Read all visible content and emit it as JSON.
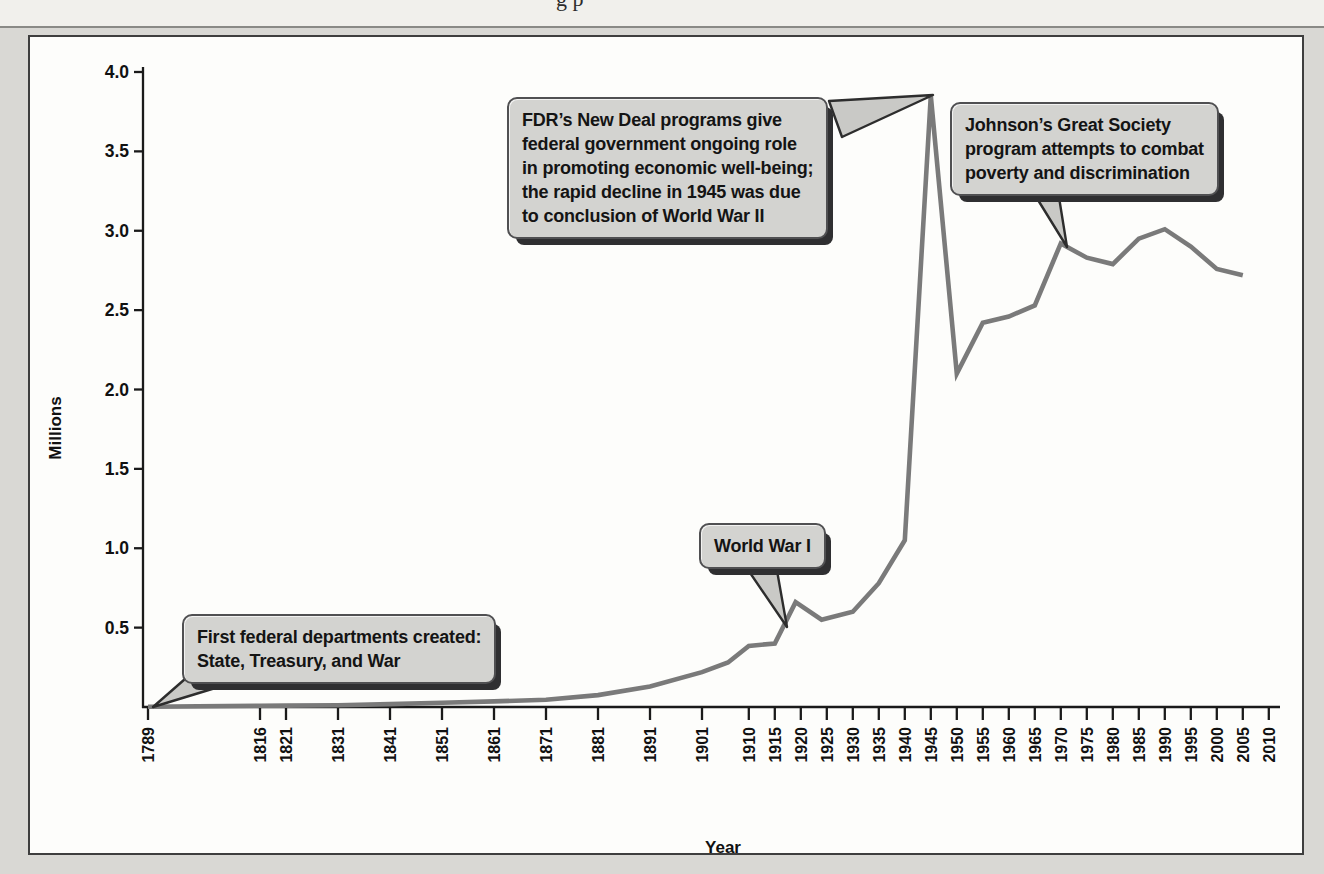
{
  "page": {
    "caption_fragment": "g p",
    "background_color": "#d9d8d4",
    "plot_background_color": "#fdfdfb",
    "frame_border_color": "#3e3e3e"
  },
  "chart_data": {
    "type": "line",
    "title": "",
    "xlabel": "Year",
    "ylabel": "Millions",
    "ylim": [
      0,
      4.0
    ],
    "grid": false,
    "legend": "none",
    "line_color": "#7a7a7a",
    "axis_color": "#1a1a1a",
    "x_ticks": [
      1789,
      1816,
      1821,
      1831,
      1841,
      1851,
      1861,
      1871,
      1881,
      1891,
      1901,
      1910,
      1915,
      1920,
      1925,
      1930,
      1935,
      1940,
      1945,
      1950,
      1955,
      1960,
      1965,
      1970,
      1975,
      1980,
      1985,
      1990,
      1995,
      2000,
      2005,
      2010
    ],
    "y_ticks": [
      0.5,
      1.0,
      1.5,
      2.0,
      2.5,
      3.0,
      3.5,
      4.0
    ],
    "series": [
      {
        "name": "Federal government civilian employment (millions)",
        "points": [
          [
            1789,
            0.002
          ],
          [
            1801,
            0.005
          ],
          [
            1816,
            0.008
          ],
          [
            1821,
            0.009
          ],
          [
            1831,
            0.011
          ],
          [
            1841,
            0.018
          ],
          [
            1851,
            0.027
          ],
          [
            1861,
            0.035
          ],
          [
            1871,
            0.046
          ],
          [
            1881,
            0.075
          ],
          [
            1891,
            0.13
          ],
          [
            1901,
            0.22
          ],
          [
            1906,
            0.28
          ],
          [
            1910,
            0.385
          ],
          [
            1915,
            0.4
          ],
          [
            1919,
            0.66
          ],
          [
            1924,
            0.55
          ],
          [
            1930,
            0.6
          ],
          [
            1935,
            0.78
          ],
          [
            1940,
            1.05
          ],
          [
            1945,
            3.85
          ],
          [
            1950,
            2.1
          ],
          [
            1955,
            2.42
          ],
          [
            1960,
            2.46
          ],
          [
            1965,
            2.53
          ],
          [
            1970,
            2.92
          ],
          [
            1975,
            2.83
          ],
          [
            1980,
            2.79
          ],
          [
            1985,
            2.95
          ],
          [
            1990,
            3.01
          ],
          [
            1995,
            2.9
          ],
          [
            2000,
            2.76
          ],
          [
            2005,
            2.72
          ]
        ]
      }
    ],
    "callouts": [
      {
        "id": "first-departments",
        "lines": [
          "First federal departments created:",
          "State, Treasury, and War"
        ],
        "anchor_year": 1789,
        "anchor_value": 0.0
      },
      {
        "id": "world-war-1",
        "lines": [
          "World War I"
        ],
        "anchor_year": 1917,
        "anchor_value": 0.53
      },
      {
        "id": "fdr-new-deal",
        "lines": [
          "FDR’s New Deal programs give",
          "federal government ongoing role",
          "in promoting economic well-being;",
          "the rapid decline in 1945 was due",
          "to conclusion of World War II"
        ],
        "anchor_year": 1945,
        "anchor_value": 3.85
      },
      {
        "id": "great-society",
        "lines": [
          "Johnson’s Great Society",
          "program attempts to combat",
          "poverty and discrimination"
        ],
        "anchor_year": 1970,
        "anchor_value": 2.92
      }
    ]
  }
}
